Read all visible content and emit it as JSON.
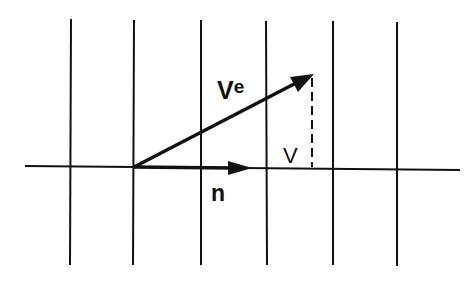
{
  "diagram": {
    "type": "vector-decomposition",
    "grid": {
      "vertical_lines_x": [
        71,
        134,
        201,
        266,
        333,
        397
      ],
      "vertical_top": 19,
      "vertical_bottom": 265,
      "horizontal_y": 167,
      "horizontal_x1": 25,
      "horizontal_x2": 460
    },
    "vectors": [
      {
        "name": "Ve",
        "from": [
          134,
          167
        ],
        "to": [
          313,
          74
        ]
      },
      {
        "name": "n",
        "from": [
          134,
          167
        ],
        "to": [
          252,
          168
        ]
      }
    ],
    "dashed_projection": {
      "x": 312,
      "y1": 78,
      "y2": 167
    },
    "labels": {
      "ve_main": "V",
      "ve_sup": "e",
      "v": "V",
      "n": "n"
    },
    "colors": {
      "ink": "#111111",
      "background": "#ffffff"
    }
  }
}
